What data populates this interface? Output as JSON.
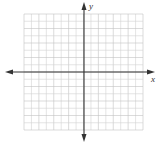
{
  "diagram": {
    "type": "coordinate-plane",
    "x_axis_label": "x",
    "y_axis_label": "y",
    "grid": {
      "cells_x": 16,
      "cells_y": 16,
      "left": 24,
      "top": 14,
      "right": 143,
      "bottom": 130
    },
    "origin": {
      "x": 84,
      "y": 72
    },
    "colors": {
      "grid": "#d4d4d4",
      "grid_major": "#c2c2c2",
      "axis": "#333333",
      "background": "#ffffff"
    }
  }
}
